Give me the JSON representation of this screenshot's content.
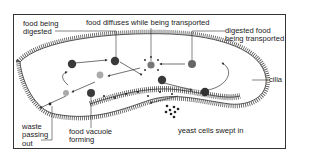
{
  "diagram": {
    "labels": {
      "food_being_digested": "food being\ndigested",
      "food_diffuses": "food diffuses while being transported",
      "digested_food_transported": "digested food\nbeing transported",
      "cilia": "cilia",
      "waste_passing_out": "waste\npassing\nout",
      "food_vacuole_forming": "food vacuole\nforming",
      "yeast_cells_swept_in": "yeast cells swept in"
    },
    "colors": {
      "line": "#333333",
      "vacuole_dark": "#3a3a3a",
      "vacuole_mid": "#777777",
      "vacuole_light": "#aaaaaa",
      "background": "#ffffff"
    }
  }
}
